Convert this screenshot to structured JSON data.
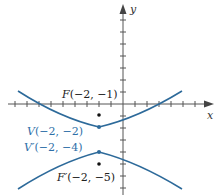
{
  "figure": {
    "type": "hyperbola-graph",
    "axes": {
      "x_label": "x",
      "y_label": "y",
      "unit_px": 12,
      "origin_px": [
        123,
        104
      ]
    },
    "colors": {
      "curve": "#2d6a9a",
      "vertex_label": "#2f6fa8",
      "focus_label": "#222222",
      "axis": "#555555",
      "point": "#111111"
    },
    "points": {
      "focus_upper": {
        "name": "F",
        "x": -2,
        "y": -1,
        "label": "F(−2, −1)"
      },
      "vertex_upper": {
        "name": "V",
        "x": -2,
        "y": -2,
        "label": "V(−2, −2)"
      },
      "vertex_lower": {
        "name": "V′",
        "x": -2,
        "y": -4,
        "label": "V′(−2, −4)"
      },
      "focus_lower": {
        "name": "F′",
        "x": -2,
        "y": -5,
        "label": "F′(−2, −5)"
      }
    },
    "labels": {
      "F": "F",
      "F_coords": "(−2, −1)",
      "V": "V",
      "V_coords": "(−2, −2)",
      "Vp": "V′",
      "Vp_coords": "(−2, −4)",
      "Fp": "F′",
      "Fp_coords": "(−2, −5)"
    }
  }
}
